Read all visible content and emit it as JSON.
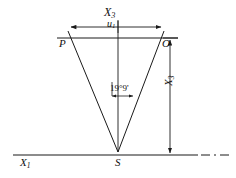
{
  "figure": {
    "stroke_color": "#1a1a1a",
    "background": "#ffffff",
    "labels": {
      "axis_top": "X",
      "axis_top_sub": "3",
      "baseline_measure": "u",
      "baseline_measure_sub": "1",
      "vertex_left": "P",
      "vertex_right": "O",
      "angle": "19°9'",
      "depth": "X",
      "depth_sub": "3",
      "axis_bottom": "X",
      "axis_bottom_sub": "1",
      "apex": "S"
    },
    "geometry": {
      "apex": {
        "x": 118,
        "y": 152
      },
      "vertex_left": {
        "x": 68,
        "y": 36
      },
      "vertex_right": {
        "x": 163,
        "y": 36
      },
      "upper_line_y": 38,
      "lower_line_y": 155,
      "center_axis_x": 118,
      "angle_degrees": 19,
      "angle_minutes": 9
    }
  }
}
